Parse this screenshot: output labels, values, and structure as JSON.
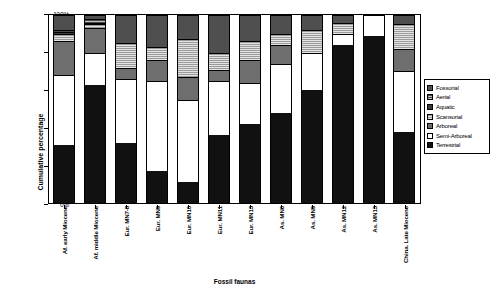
{
  "chart_data": {
    "type": "bar",
    "subtype": "stacked-100-percent",
    "title": "",
    "xlabel": "Fossil faunas",
    "ylabel": "Cumulative percentage",
    "ylim": [
      0,
      100
    ],
    "yticks": [
      "0%",
      "20%",
      "40%",
      "60%",
      "80%",
      "100%"
    ],
    "ytick_values": [
      0,
      20,
      40,
      60,
      80,
      100
    ],
    "grid": false,
    "legend_position": "right",
    "categories": [
      "Af. early Miocene",
      "Af. middle Miocene",
      "Eur. MN7-8",
      "Eur. MN9",
      "Eur. MN10",
      "Eur. MN11",
      "Eur. MN13",
      "As. MN6",
      "As. MN9",
      "As. MN12",
      "As. MN13",
      "China. Late Miocene"
    ],
    "series": [
      {
        "name": "Terrestrial",
        "pattern": "solid-black",
        "values": [
          31,
          63,
          32,
          17,
          11,
          36,
          42,
          48,
          60,
          84,
          89,
          38
        ]
      },
      {
        "name": "Semi-Arboreal",
        "pattern": "solid-white",
        "values": [
          37,
          17,
          34,
          48,
          44,
          29,
          22,
          26,
          20,
          6,
          11,
          32
        ]
      },
      {
        "name": "Arboreal",
        "pattern": "solid-dark-gray",
        "values": [
          18,
          13,
          6,
          11,
          12,
          6,
          12,
          10,
          0,
          0,
          0,
          12
        ]
      },
      {
        "name": "Scansorial",
        "pattern": "horizontal-lines",
        "values": [
          4,
          2,
          13,
          7,
          20,
          9,
          10,
          6,
          12,
          6,
          0,
          13
        ]
      },
      {
        "name": "Aquatic",
        "pattern": "solid-gray",
        "values": [
          1,
          1,
          0,
          0,
          0,
          0,
          0,
          0,
          0,
          0,
          0,
          0
        ]
      },
      {
        "name": "Aerial",
        "pattern": "fine-lines",
        "values": [
          1,
          2,
          0,
          0,
          0,
          0,
          0,
          0,
          0,
          0,
          0,
          0
        ]
      },
      {
        "name": "Fossorial",
        "pattern": "solid-mid-gray",
        "values": [
          8,
          2,
          15,
          17,
          13,
          20,
          14,
          10,
          8,
          4,
          0,
          5
        ]
      }
    ],
    "legend": [
      {
        "label": "Fossorial",
        "swatch": "solid-mid-gray"
      },
      {
        "label": "Aerial",
        "swatch": "fine-lines"
      },
      {
        "label": "Aquatic",
        "swatch": "solid-gray"
      },
      {
        "label": "Scansorial",
        "swatch": "horizontal-lines"
      },
      {
        "label": "Arboreal",
        "swatch": "solid-dark-gray"
      },
      {
        "label": "Semi-Arboreal",
        "swatch": "solid-white"
      },
      {
        "label": "Terrestrial",
        "swatch": "solid-black"
      }
    ]
  }
}
